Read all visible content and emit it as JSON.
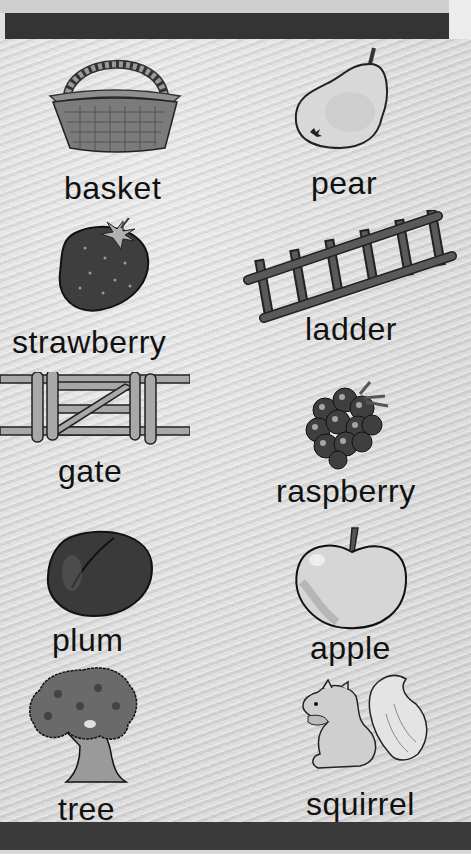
{
  "page": {
    "type": "picture vocabulary worksheet",
    "background_color": "#dcdcdc",
    "band_color": "#343434"
  },
  "items": [
    {
      "word": "basket",
      "icon": "basket-icon",
      "column": "left",
      "row": 1
    },
    {
      "word": "pear",
      "icon": "pear-icon",
      "column": "right",
      "row": 1
    },
    {
      "word": "strawberry",
      "icon": "strawberry-icon",
      "column": "left",
      "row": 2
    },
    {
      "word": "ladder",
      "icon": "ladder-icon",
      "column": "right",
      "row": 2
    },
    {
      "word": "gate",
      "icon": "gate-icon",
      "column": "left",
      "row": 3
    },
    {
      "word": "raspberry",
      "icon": "raspberry-icon",
      "column": "right",
      "row": 3
    },
    {
      "word": "plum",
      "icon": "plum-icon",
      "column": "left",
      "row": 4
    },
    {
      "word": "apple",
      "icon": "apple-icon",
      "column": "right",
      "row": 4
    },
    {
      "word": "tree",
      "icon": "tree-icon",
      "column": "left",
      "row": 5
    },
    {
      "word": "squirrel",
      "icon": "squirrel-icon",
      "column": "right",
      "row": 5
    }
  ]
}
